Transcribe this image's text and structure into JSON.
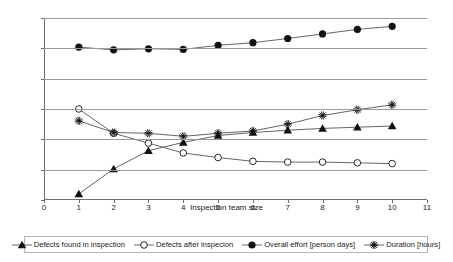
{
  "chart_data": {
    "type": "line",
    "title": "",
    "xlabel": "Inspection team size",
    "ylabel": "",
    "x": [
      1,
      2,
      3,
      4,
      5,
      6,
      7,
      8,
      9,
      10
    ],
    "xlim": [
      0,
      11
    ],
    "ylim": [
      200,
      1400
    ],
    "xticks": [
      0,
      1,
      2,
      3,
      4,
      5,
      6,
      7,
      8,
      9,
      10,
      11
    ],
    "yticks": [
      200,
      400,
      600,
      800,
      1000,
      1200,
      1400
    ],
    "grid": "horizontal",
    "legend_position": "bottom",
    "series": [
      {
        "name": "Defects found in inspection",
        "marker": "filled-triangle",
        "values": [
          240,
          405,
          525,
          580,
          625,
          645,
          660,
          672,
          680,
          688
        ]
      },
      {
        "name": "Defects after inspecion",
        "marker": "open-circle",
        "values": [
          800,
          640,
          575,
          510,
          480,
          455,
          450,
          450,
          445,
          440
        ]
      },
      {
        "name": "Overall effort [person days]",
        "marker": "filled-circle",
        "values": [
          1208,
          1190,
          1197,
          1193,
          1220,
          1237,
          1265,
          1295,
          1325,
          1345
        ]
      },
      {
        "name": "Duration [hours]",
        "marker": "asterisk",
        "values": [
          722,
          645,
          640,
          620,
          640,
          655,
          700,
          757,
          795,
          828
        ]
      }
    ]
  },
  "axis": {
    "x_title": "Inspection team size",
    "x_tick_labels": [
      "0",
      "1",
      "2",
      "3",
      "4",
      "5",
      "6",
      "7",
      "8",
      "9",
      "10",
      "11"
    ],
    "y_tick_labels": [
      "200",
      "400",
      "600",
      "800",
      "1000",
      "1200",
      "1400"
    ]
  },
  "legend": {
    "items": [
      {
        "label": "Defects found in inspection",
        "icon": "filled-triangle-marker-icon"
      },
      {
        "label": "Defects after inspecion",
        "icon": "open-circle-marker-icon"
      },
      {
        "label": "Overall effort [person days]",
        "icon": "filled-circle-marker-icon"
      },
      {
        "label": "Duration [hours]",
        "icon": "asterisk-marker-icon"
      }
    ]
  },
  "colors": {
    "line": "#555555",
    "marker": "#111111",
    "grid": "#9a9a9a",
    "axis": "#6e6e6e",
    "background": "#ffffff"
  }
}
